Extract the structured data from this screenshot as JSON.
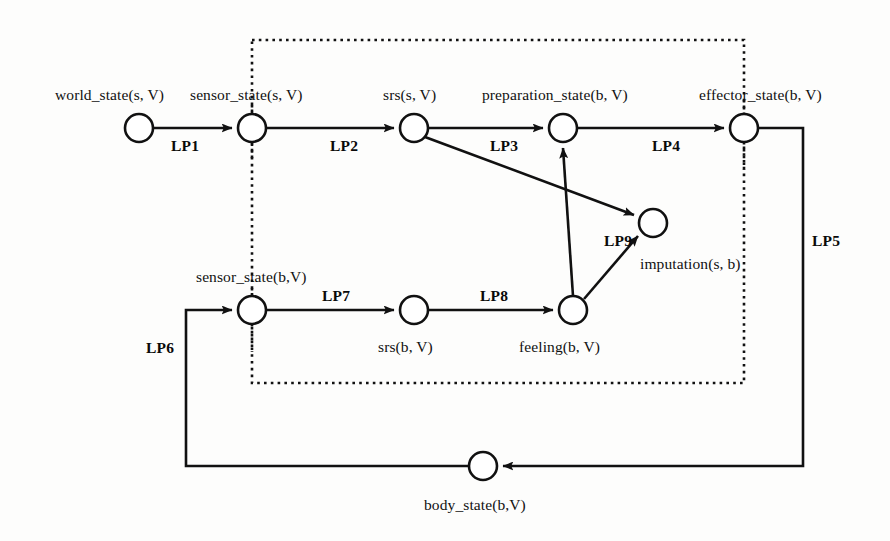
{
  "diagram": {
    "type": "process-flow-graph",
    "background_color": "#fdfdfc",
    "stroke_color": "#111111",
    "node_radius": 14,
    "boundary_box": {
      "name": "agent-boundary",
      "style": "dotted",
      "x": 252,
      "y": 40,
      "width": 492,
      "height": 343
    },
    "nodes": [
      {
        "id": "world_state",
        "label": "world_state(s, V)",
        "cx": 139,
        "cy": 128,
        "label_x": 55,
        "label_y": 86,
        "dotted_stub": false
      },
      {
        "id": "sensor_state_s",
        "label": "sensor_state(s, V)",
        "cx": 252,
        "cy": 128,
        "label_x": 190,
        "label_y": 86,
        "dotted_stub": true
      },
      {
        "id": "srs_s",
        "label": "srs(s, V)",
        "cx": 414,
        "cy": 128,
        "label_x": 383,
        "label_y": 86,
        "dotted_stub": false
      },
      {
        "id": "preparation_state",
        "label": "preparation_state(b, V)",
        "cx": 563,
        "cy": 128,
        "label_x": 482,
        "label_y": 86,
        "dotted_stub": false
      },
      {
        "id": "effector_state",
        "label": "effector_state(b, V)",
        "cx": 744,
        "cy": 128,
        "label_x": 699,
        "label_y": 86,
        "dotted_stub": true
      },
      {
        "id": "imputation",
        "label": "imputation(s, b)",
        "cx": 653,
        "cy": 223,
        "label_x": 640,
        "label_y": 255,
        "dotted_stub": false
      },
      {
        "id": "sensor_state_b",
        "label": "sensor_state(b,V)",
        "cx": 252,
        "cy": 310,
        "label_x": 196,
        "label_y": 268,
        "dotted_stub": true
      },
      {
        "id": "srs_b",
        "label": "srs(b, V)",
        "cx": 414,
        "cy": 310,
        "label_x": 378,
        "label_y": 338,
        "dotted_stub": false
      },
      {
        "id": "feeling",
        "label": "feeling(b, V)",
        "cx": 573,
        "cy": 310,
        "label_x": 519,
        "label_y": 338,
        "dotted_stub": false
      },
      {
        "id": "body_state",
        "label": "body_state(b,V)",
        "cx": 483,
        "cy": 466,
        "label_x": 424,
        "label_y": 496,
        "dotted_stub": false
      }
    ],
    "edges": [
      {
        "id": "LP1",
        "label": "LP1",
        "from": "world_state",
        "to": "sensor_state_s",
        "label_x": 171,
        "label_y": 137
      },
      {
        "id": "LP2",
        "label": "LP2",
        "from": "sensor_state_s",
        "to": "srs_s",
        "label_x": 330,
        "label_y": 137
      },
      {
        "id": "LP3",
        "label": "LP3",
        "from": "srs_s",
        "to": "preparation_state",
        "label_x": 490,
        "label_y": 137
      },
      {
        "id": "LP4",
        "label": "LP4",
        "from": "preparation_state",
        "to": "effector_state",
        "label_x": 652,
        "label_y": 137
      },
      {
        "id": "LP5",
        "label": "LP5",
        "from": "effector_state",
        "to": "body_state",
        "label_x": 812,
        "label_y": 232
      },
      {
        "id": "LP6",
        "label": "LP6",
        "from": "body_state",
        "to": "sensor_state_b",
        "label_x": 146,
        "label_y": 339
      },
      {
        "id": "LP7",
        "label": "LP7",
        "from": "sensor_state_b",
        "to": "srs_b",
        "label_x": 322,
        "label_y": 287
      },
      {
        "id": "LP8",
        "label": "LP8",
        "from": "srs_b",
        "to": "feeling",
        "label_x": 480,
        "label_y": 287
      },
      {
        "id": "LP9",
        "label": "LP9",
        "from": "feeling",
        "to": "imputation",
        "label_x": 604,
        "label_y": 232
      },
      {
        "id": "srs_s_to_imputation",
        "label": "",
        "from": "srs_s",
        "to": "imputation",
        "label_x": 0,
        "label_y": 0
      },
      {
        "id": "feeling_to_preparation_state",
        "label": "",
        "from": "feeling",
        "to": "preparation_state",
        "label_x": 0,
        "label_y": 0
      }
    ]
  }
}
